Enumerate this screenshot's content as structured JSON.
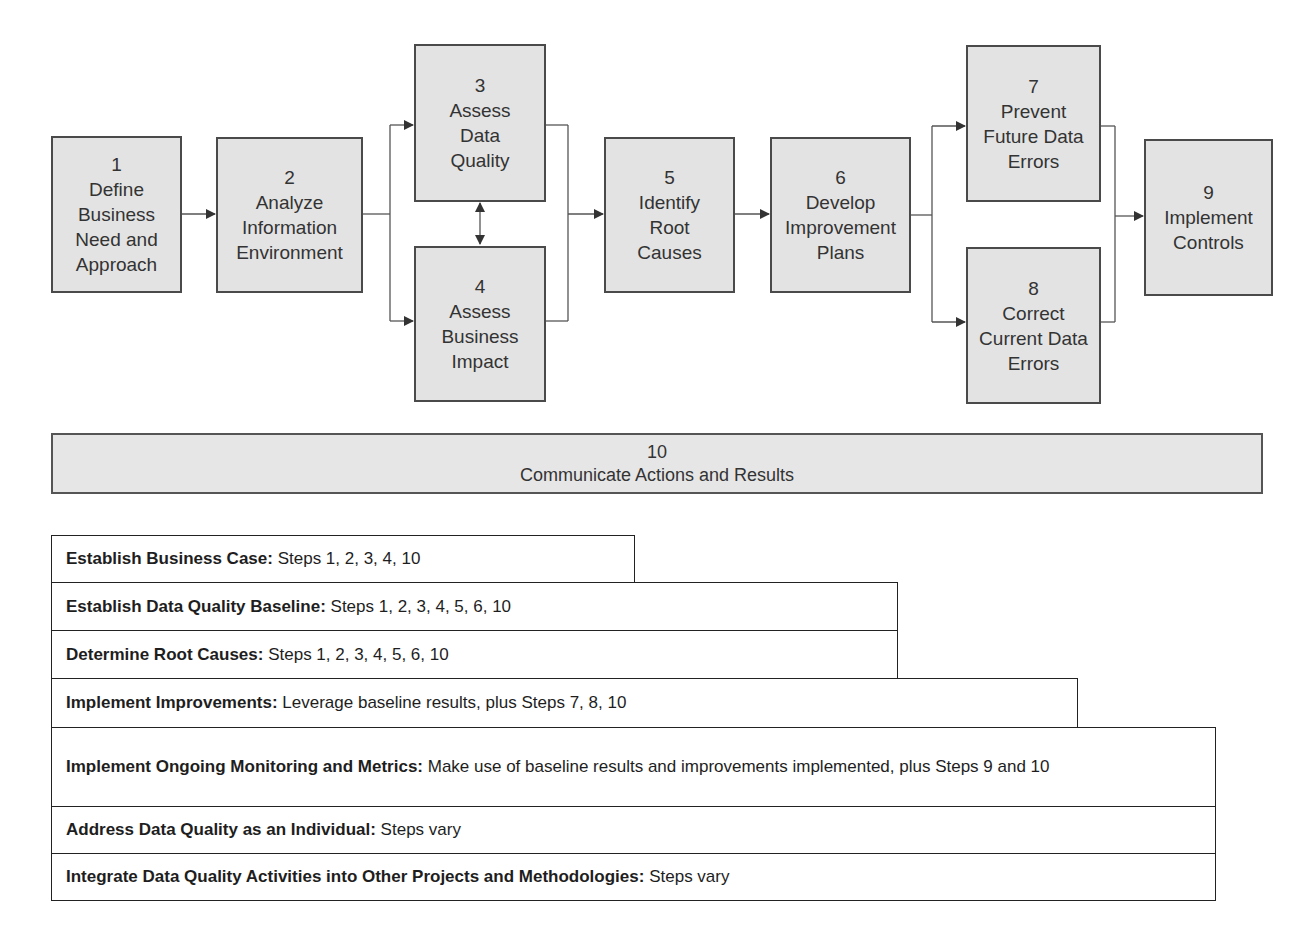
{
  "diagram": {
    "steps": [
      {
        "num": "1",
        "label": "Define\nBusiness\nNeed and\nApproach"
      },
      {
        "num": "2",
        "label": "Analyze\nInformation\nEnvironment"
      },
      {
        "num": "3",
        "label": "Assess\nData\nQuality"
      },
      {
        "num": "4",
        "label": "Assess\nBusiness\nImpact"
      },
      {
        "num": "5",
        "label": "Identify\nRoot\nCauses"
      },
      {
        "num": "6",
        "label": "Develop\nImprovement\nPlans"
      },
      {
        "num": "7",
        "label": "Prevent\nFuture Data\nErrors"
      },
      {
        "num": "8",
        "label": "Correct\nCurrent Data\nErrors"
      },
      {
        "num": "9",
        "label": "Implement\nControls"
      }
    ],
    "band": {
      "num": "10",
      "label": "Communicate Actions and Results"
    },
    "colors": {
      "box_fill": "#e3e3e3",
      "box_border": "#4a4a4a",
      "line": "#555555"
    }
  },
  "approaches": [
    {
      "title": "Establish Business Case:",
      "text": "Steps 1, 2, 3, 4, 10"
    },
    {
      "title": "Establish Data Quality Baseline:",
      "text": "Steps 1, 2, 3, 4, 5, 6, 10"
    },
    {
      "title": "Determine Root Causes:",
      "text": "Steps 1, 2, 3, 4, 5, 6, 10"
    },
    {
      "title": "Implement Improvements:",
      "text": "Leverage baseline results, plus Steps 7, 8, 10"
    },
    {
      "title": "Implement Ongoing Monitoring and Metrics:",
      "text": "Make use of baseline results and improvements implemented, plus Steps 9 and 10"
    },
    {
      "title": "Address Data Quality as an Individual:",
      "text": "Steps vary"
    },
    {
      "title": "Integrate Data Quality Activities into Other Projects and Methodologies:",
      "text": "Steps vary"
    }
  ]
}
